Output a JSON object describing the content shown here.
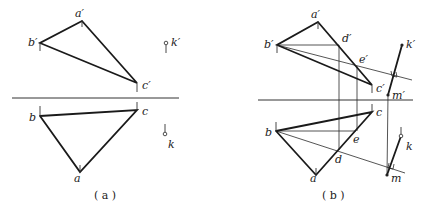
{
  "figure": {
    "panels": [
      {
        "id": "a",
        "caption": "( a )",
        "labels": {
          "a_prime": "a′",
          "b_prime": "b′",
          "c_prime": "c′",
          "k_prime": "k′",
          "a": "a",
          "b": "b",
          "c": "c",
          "k": "k"
        }
      },
      {
        "id": "b",
        "caption": "( b )",
        "labels": {
          "a_prime": "a′",
          "b_prime": "b′",
          "c_prime": "c′",
          "d_prime": "d′",
          "e_prime": "e′",
          "k_prime": "k′",
          "m_prime": "m′",
          "a": "a",
          "b": "b",
          "c": "c",
          "d": "d",
          "e": "e",
          "k": "k",
          "m": "m"
        }
      }
    ]
  }
}
